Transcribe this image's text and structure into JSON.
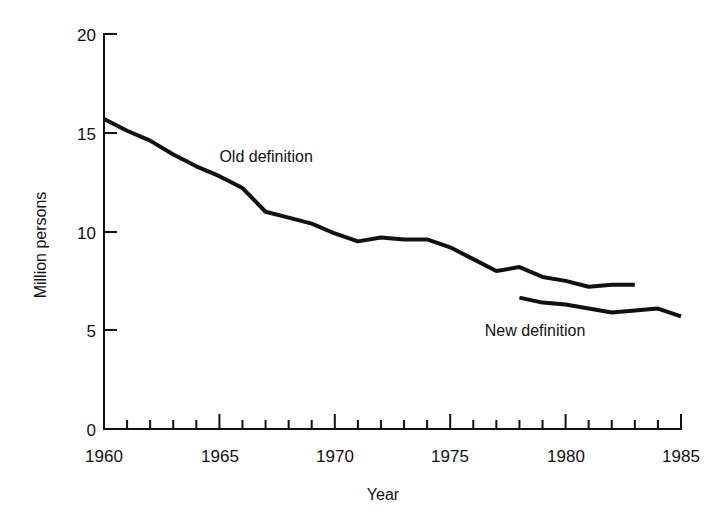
{
  "chart_data": {
    "type": "line",
    "title": "",
    "xlabel": "Year",
    "ylabel": "Million persons",
    "xlim": [
      1960,
      1985
    ],
    "ylim": [
      0,
      20
    ],
    "grid": false,
    "legend_position": "inline-annotation",
    "x_major_ticks": [
      1960,
      1965,
      1970,
      1975,
      1980,
      1985
    ],
    "x_major_tick_labels": [
      "1960",
      "1965",
      "1970",
      "1975",
      "1980",
      "1985"
    ],
    "x_minor_ticks": [
      1961,
      1962,
      1963,
      1964,
      1966,
      1967,
      1968,
      1969,
      1971,
      1972,
      1973,
      1974,
      1976,
      1977,
      1978,
      1979,
      1981,
      1982,
      1983,
      1984
    ],
    "y_ticks": [
      0,
      5,
      10,
      15,
      20
    ],
    "y_tick_labels": [
      "0",
      "5",
      "10",
      "15",
      "20"
    ],
    "series": [
      {
        "name": "Old definition",
        "label": "Old definition",
        "color": "#111111",
        "x": [
          1960,
          1961,
          1962,
          1963,
          1964,
          1965,
          1966,
          1967,
          1968,
          1969,
          1970,
          1971,
          1972,
          1973,
          1974,
          1975,
          1976,
          1977,
          1978,
          1979,
          1980,
          1981,
          1982,
          1983
        ],
        "values": [
          15.7,
          15.1,
          14.6,
          13.9,
          13.3,
          12.8,
          12.2,
          11.0,
          10.7,
          10.4,
          9.9,
          9.5,
          9.7,
          9.6,
          9.6,
          9.2,
          8.6,
          8.0,
          8.2,
          7.7,
          7.5,
          7.2,
          7.3,
          7.3
        ],
        "label_x": 1965.0,
        "label_y": 13.5
      },
      {
        "name": "New definition",
        "label": "New definition",
        "color": "#111111",
        "x": [
          1978,
          1979,
          1980,
          1981,
          1982,
          1983,
          1984,
          1985
        ],
        "values": [
          6.65,
          6.4,
          6.3,
          6.1,
          5.9,
          6.0,
          6.1,
          5.7
        ],
        "label_x": 1976.5,
        "label_y": 4.7
      }
    ]
  },
  "labels": {
    "x_axis_title": "Year",
    "y_axis_title": "Million persons",
    "old_definition": "Old definition",
    "new_definition": "New definition",
    "y_0": "0",
    "y_5": "5",
    "y_10": "10",
    "y_15": "15",
    "y_20": "20",
    "x_1960": "1960",
    "x_1965": "1965",
    "x_1970": "1970",
    "x_1975": "1975",
    "x_1980": "1980",
    "x_1985": "1985"
  },
  "colors": {
    "background": "#ffffff",
    "ink": "#111111",
    "line": "#111111"
  }
}
